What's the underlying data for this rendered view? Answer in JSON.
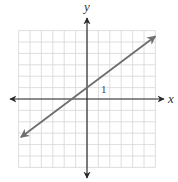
{
  "chart_data": {
    "type": "line",
    "title": "",
    "xlabel": "x",
    "ylabel": "y",
    "xlim": [
      -6,
      6
    ],
    "ylim": [
      -6,
      6
    ],
    "grid": true,
    "grid_step": 1,
    "tick_labels": [
      {
        "value": "1",
        "position": [
          1,
          1
        ]
      }
    ],
    "series": [
      {
        "name": "line",
        "equation": "y = (3/4)x + 1",
        "slope": 0.75,
        "intercept": 1,
        "x": [
          -5.8,
          6.0
        ],
        "y": [
          -3.35,
          5.5
        ],
        "arrows_both_ends": true,
        "color": "#6e6e6e"
      }
    ],
    "legend": null
  },
  "axes": {
    "x_label": "x",
    "y_label": "y",
    "unit_label": "1"
  },
  "colors": {
    "grid": "#d6d6d6",
    "axes": "#2a2a2a",
    "line": "#6e6e6e"
  }
}
